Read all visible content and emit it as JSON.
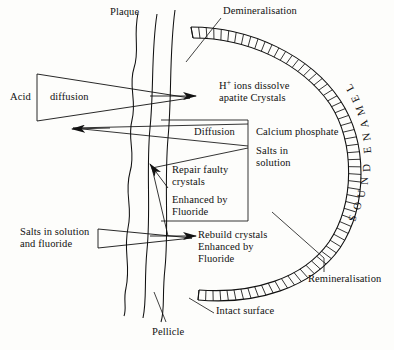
{
  "figure": {
    "kind": "dental-caries-enamel-demineralisation-remineralisation-diagram",
    "background_color": "#fdfdfb",
    "ink_color": "#111111"
  },
  "labels": {
    "plaque": "Plaque",
    "demineralisation": "Demineralisation",
    "acid": "Acid",
    "diffusion_triangle": "diffusion",
    "h_ions_line1_pre": "H",
    "h_ions_line1_sup": "+",
    "h_ions_line1_post": " ions dissolve",
    "h_ions_line2": "apatite Crystals",
    "diffusion_box": "Diffusion",
    "calcium_phosphate": "Calcium phosphate",
    "salts_in_line1": "Salts in",
    "salts_in_line2": "solution",
    "repair_line1": "Repair faulty",
    "repair_line2": "crystals",
    "enhanced_line1": "Enhanced by",
    "enhanced_line2": "Fluoride",
    "salts_fluoride_line1": "Salts in solution",
    "salts_fluoride_line2": "and fluoride",
    "rebuild_line1": "Rebuild crystals",
    "rebuild_line2": "Enhanced by",
    "rebuild_line3": "Fluoride",
    "remineralisation": "Remineralisation",
    "intact_surface": "Intact surface",
    "pellicle": "Pellicle"
  },
  "sound_enamel": {
    "text": "SOUND ENAMEL",
    "letters": [
      {
        "ch": "S",
        "x": 352,
        "y": 218,
        "rot": -76
      },
      {
        "ch": "O",
        "x": 357,
        "y": 206,
        "rot": -80
      },
      {
        "ch": "U",
        "x": 361,
        "y": 194,
        "rot": -84
      },
      {
        "ch": "N",
        "x": 364,
        "y": 181,
        "rot": -88
      },
      {
        "ch": "D",
        "x": 366,
        "y": 168,
        "rot": -92
      },
      {
        "ch": "E",
        "x": 367,
        "y": 150,
        "rot": -96
      },
      {
        "ch": "N",
        "x": 366,
        "y": 137,
        "rot": -100
      },
      {
        "ch": "A",
        "x": 364,
        "y": 124,
        "rot": -104
      },
      {
        "ch": "M",
        "x": 360,
        "y": 111,
        "rot": -109
      },
      {
        "ch": "E",
        "x": 355,
        "y": 99,
        "rot": -114
      },
      {
        "ch": "L",
        "x": 349,
        "y": 88,
        "rot": -119
      }
    ]
  },
  "geometry": {
    "enamel_band": {
      "outer_path": "M 191 27 C 250 27 310 55 340 100 C 368 142 368 205 340 248 C 312 288 256 305 198 300",
      "inner_path": "M 193 38 C 248 38 301 63 330 104 C 355 143 355 203 329 242 C 303 279 252 294 199 290",
      "hatch_count": 64
    },
    "plaque_wavy_path": "M 138 13 C 133 38 140 50 134 68 C 128 86 137 100 132 120 C 127 140 136 152 130 172 C 124 194 133 206 128 228 C 123 252 131 264 126 288 C 123 300 127 308 124 316",
    "pellicle_curve_inner": "M 157 14 C 151 52 154 90 150 128 C 146 170 151 210 147 250 C 144 282 147 300 143 318",
    "pellicle_curve_outer": "M 175 10 C 169 54 172 96 168 138 C 164 184 169 228 165 268 C 162 296 165 310 161 322"
  },
  "chart_data": {
    "type": "diagram",
    "regions": [
      {
        "name": "Plaque",
        "description": "wavy vertical line left of enamel"
      },
      {
        "name": "Pellicle",
        "description": "two smooth vertical curves adjacent to enamel surface"
      },
      {
        "name": "Sound enamel",
        "description": "hatched arc band on the right"
      },
      {
        "name": "Demineralisation",
        "description": "upper portion of enamel band"
      },
      {
        "name": "Remineralisation",
        "description": "lower portion of enamel band"
      },
      {
        "name": "Intact surface",
        "description": "bottom edge of enamel band"
      }
    ],
    "flows": [
      {
        "name": "Acid diffusion",
        "direction": "inward",
        "target": "H+ ions dissolve apatite Crystals"
      },
      {
        "name": "Diffusion",
        "direction": "outward",
        "target": "Calcium phosphate Salts in solution"
      },
      {
        "name": "Repair faulty crystals Enhanced by Fluoride",
        "direction": "inward"
      },
      {
        "name": "Salts in solution and fluoride",
        "direction": "inward",
        "target": "Rebuild crystals Enhanced by Fluoride"
      }
    ]
  }
}
